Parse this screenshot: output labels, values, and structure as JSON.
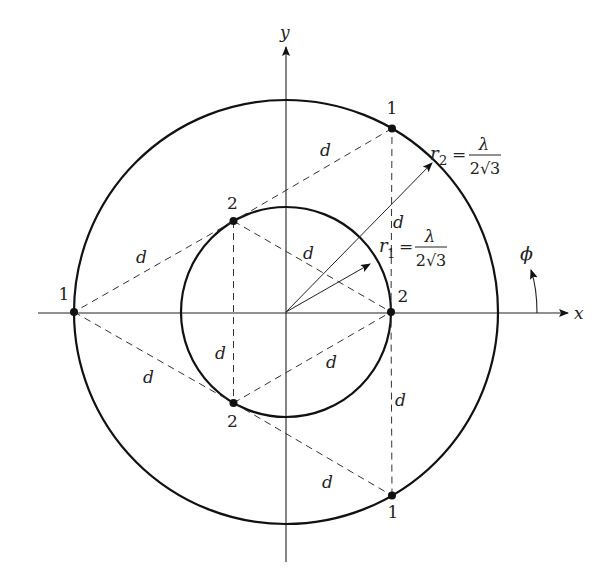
{
  "diagram": {
    "title": "",
    "axes": {
      "x_label": "x",
      "y_label": "y",
      "angle_label": "ϕ"
    },
    "circles": [
      {
        "name": "outer",
        "radius_label": "r",
        "radius_subscript": "2",
        "equals": "=",
        "numerator": "λ",
        "denominator": "2√3"
      },
      {
        "name": "inner",
        "radius_label": "r",
        "radius_subscript": "1",
        "equals": "=",
        "numerator": "λ",
        "denominator": "2√3"
      }
    ],
    "points": [
      {
        "label": "1",
        "ring": "outer",
        "angle_deg": 60
      },
      {
        "label": "1",
        "ring": "outer",
        "angle_deg": 180
      },
      {
        "label": "1",
        "ring": "outer",
        "angle_deg": 300
      },
      {
        "label": "2",
        "ring": "inner",
        "angle_deg": 0
      },
      {
        "label": "2",
        "ring": "inner",
        "angle_deg": 120
      },
      {
        "label": "2",
        "ring": "inner",
        "angle_deg": 240
      }
    ],
    "distance_label": "d",
    "edges": [
      {
        "from": 0,
        "to": 4,
        "label": "d"
      },
      {
        "from": 4,
        "to": 1,
        "label": "d"
      },
      {
        "from": 1,
        "to": 5,
        "label": "d"
      },
      {
        "from": 5,
        "to": 2,
        "label": "d"
      },
      {
        "from": 2,
        "to": 3,
        "label": "d"
      },
      {
        "from": 3,
        "to": 0,
        "label": "d"
      },
      {
        "from": 4,
        "to": 5,
        "label": "d"
      },
      {
        "from": 4,
        "to": 3,
        "label": "d"
      },
      {
        "from": 5,
        "to": 3,
        "label": "d"
      }
    ]
  }
}
